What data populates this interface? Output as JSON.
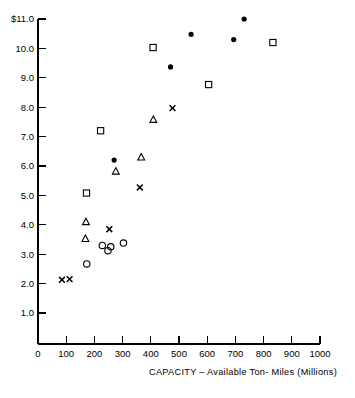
{
  "chart_data": {
    "type": "scatter",
    "title": "",
    "xlabel": "CAPACITY – Available Ton- Miles (Millions)",
    "ylabel": "",
    "xlim": [
      0,
      1000
    ],
    "ylim": [
      0,
      11.0
    ],
    "grid": false,
    "legend": "none",
    "x_ticks": [
      0,
      100,
      200,
      300,
      400,
      500,
      600,
      700,
      800,
      900,
      1000
    ],
    "x_tick_labels": [
      "0",
      "100",
      "200",
      "300",
      "400",
      "500",
      "600",
      "700",
      "800",
      "900",
      "1000"
    ],
    "y_ticks": [
      1.0,
      2.0,
      3.0,
      4.0,
      5.0,
      6.0,
      7.0,
      8.0,
      9.0,
      10.0,
      11.0
    ],
    "y_tick_labels": [
      "1.0",
      "2.0",
      "3.0",
      "4.0",
      "5.0",
      "6.0",
      "7.0",
      "8.0",
      "9.0",
      "10.0",
      "$11.0"
    ],
    "series": [
      {
        "name": "filled-circle",
        "marker": "filled-circle",
        "points": [
          {
            "x": 270,
            "y": 6.2
          },
          {
            "x": 470,
            "y": 9.37
          },
          {
            "x": 543,
            "y": 10.48
          },
          {
            "x": 694,
            "y": 10.3
          },
          {
            "x": 731,
            "y": 11.0
          }
        ]
      },
      {
        "name": "open-square",
        "marker": "open-square",
        "points": [
          {
            "x": 172,
            "y": 5.08
          },
          {
            "x": 222,
            "y": 7.2
          },
          {
            "x": 408,
            "y": 10.03
          },
          {
            "x": 605,
            "y": 8.77
          },
          {
            "x": 833,
            "y": 10.2
          }
        ]
      },
      {
        "name": "open-triangle",
        "marker": "open-triangle",
        "points": [
          {
            "x": 168,
            "y": 3.53
          },
          {
            "x": 170,
            "y": 4.1
          },
          {
            "x": 276,
            "y": 5.82
          },
          {
            "x": 366,
            "y": 6.3
          },
          {
            "x": 409,
            "y": 7.58
          }
        ]
      },
      {
        "name": "open-circle",
        "marker": "open-circle",
        "points": [
          {
            "x": 173,
            "y": 2.67
          },
          {
            "x": 228,
            "y": 3.3
          },
          {
            "x": 248,
            "y": 3.12
          },
          {
            "x": 258,
            "y": 3.25
          },
          {
            "x": 303,
            "y": 3.38
          }
        ]
      },
      {
        "name": "x-mark",
        "marker": "x",
        "points": [
          {
            "x": 85,
            "y": 2.13
          },
          {
            "x": 112,
            "y": 2.15
          },
          {
            "x": 253,
            "y": 3.85
          },
          {
            "x": 361,
            "y": 5.27
          },
          {
            "x": 477,
            "y": 7.97
          }
        ]
      }
    ]
  },
  "colors": {
    "ink": "#000000",
    "background": "#ffffff"
  }
}
